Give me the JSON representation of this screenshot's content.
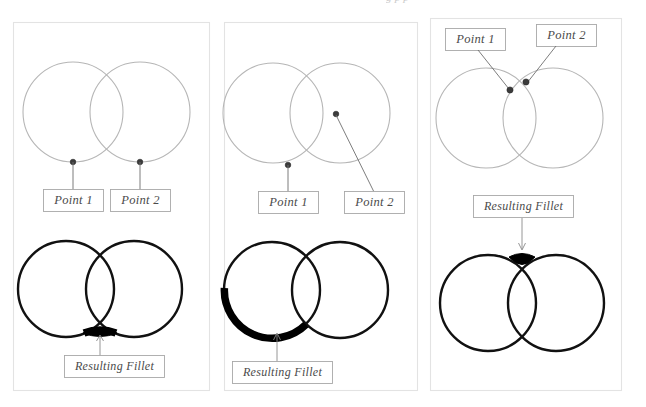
{
  "page": {
    "background_color": "#ffffff",
    "width": 646,
    "height": 407,
    "cutoff_header_text": "g  p  p",
    "panel_border_color": "#e3e3e3",
    "light_circle_color": "#b6b6b6",
    "dark_circle_color": "#111111",
    "fillet_color": "#000000",
    "label_text_color": "#4a4a4a",
    "label_border_color": "#a8a8a8",
    "leader_color": "#6e6e6e"
  },
  "panels": [
    {
      "id": "panel-1",
      "name": "fillet-example-bottom-tangent",
      "top_row": {
        "caption_1": "Point 1",
        "caption_2": "Point 2",
        "point_1_position": "bottom of left circle",
        "point_2_position": "bottom of right circle"
      },
      "bottom_row": {
        "caption": "Resulting Fillet",
        "fillet_description": "small arc at lower intersection"
      }
    },
    {
      "id": "panel-2",
      "name": "fillet-example-large-arc",
      "top_row": {
        "caption_1": "Point 1",
        "caption_2": "Point 2",
        "point_1_position": "bottom of left circle",
        "point_2_position": "upper intersection region"
      },
      "bottom_row": {
        "caption": "Resulting Fillet",
        "fillet_description": "large arc around lower-left of left circle"
      }
    },
    {
      "id": "panel-3",
      "name": "fillet-example-top-intersection",
      "top_row": {
        "caption_1": "Point 1",
        "caption_2": "Point 2",
        "point_1_position": "left circle near upper intersection",
        "point_2_position": "right circle near upper intersection"
      },
      "bottom_row": {
        "caption": "Resulting Fillet",
        "fillet_description": "small wedge at upper intersection"
      }
    }
  ]
}
